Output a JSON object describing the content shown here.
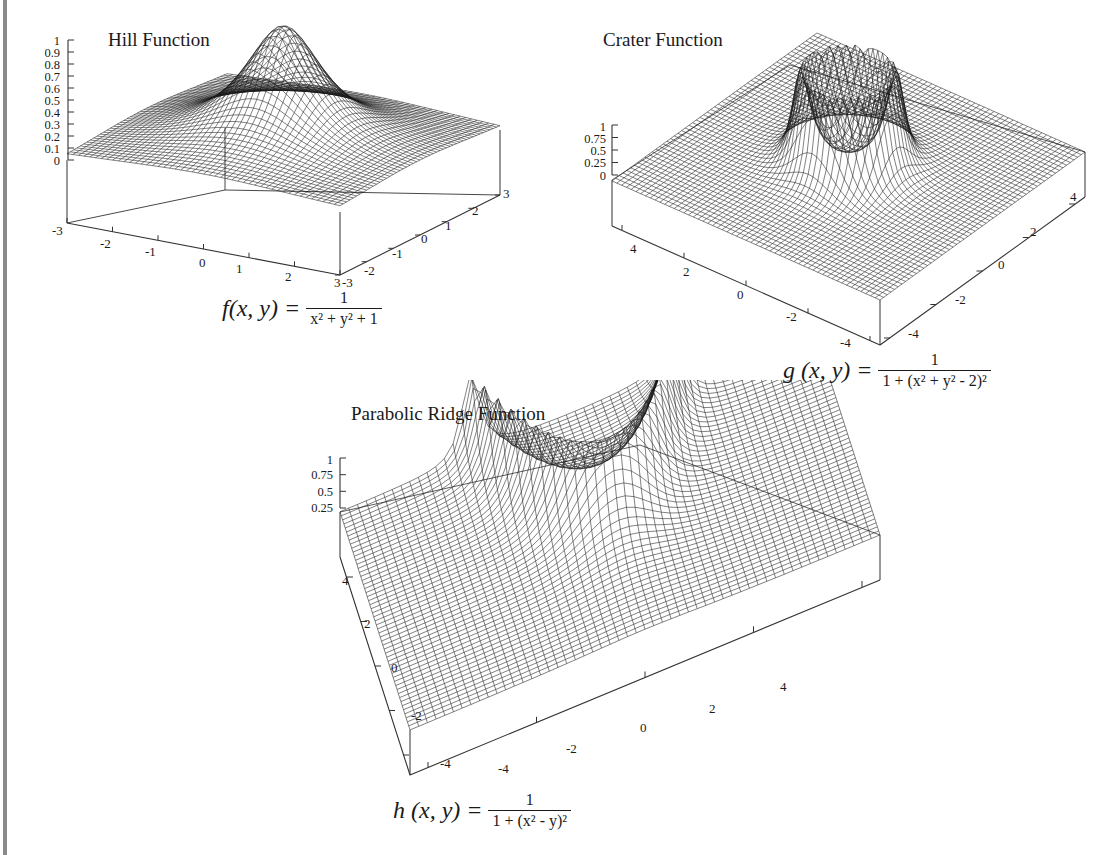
{
  "chart_data": [
    {
      "type": "surface3d",
      "title": "Hill Function",
      "formula": {
        "lhs": "f(x, y) =",
        "numerator": "1",
        "denominator": "x² + y² + 1"
      },
      "function": "1/(x^2+y^2+1)",
      "x_range": [
        -3,
        3
      ],
      "y_range": [
        -3,
        3
      ],
      "z_range": [
        0,
        1
      ],
      "z_ticks": [
        "1",
        "0.9",
        "0.8",
        "0.7",
        "0.6",
        "0.5",
        "0.4",
        "0.3",
        "0.2",
        "0.1",
        "0"
      ],
      "x_ticks": [
        "-3",
        "-2",
        "-1",
        "0",
        "1",
        "2",
        "3"
      ],
      "y_ticks": [
        "-3",
        "-2",
        "-1",
        "0",
        "1",
        "2",
        "3"
      ],
      "grid": true
    },
    {
      "type": "surface3d",
      "title": "Crater Function",
      "formula": {
        "lhs": "g (x, y) =",
        "numerator": "1",
        "denominator": "1 + (x² + y² - 2)²"
      },
      "function": "1/(1+(x^2+y^2-2)^2)",
      "x_range": [
        -5,
        5
      ],
      "y_range": [
        -5,
        5
      ],
      "z_range": [
        0,
        1
      ],
      "z_ticks": [
        "1",
        "0.75",
        "0.5",
        "0.25",
        "0"
      ],
      "x_ticks": [
        "4",
        "2",
        "0",
        "-2",
        "-4"
      ],
      "y_ticks": [
        "-4",
        "-2",
        "0",
        "2",
        "4"
      ],
      "grid": true
    },
    {
      "type": "surface3d",
      "title": "Parabolic Ridge Function",
      "formula": {
        "lhs": "h (x, y) =",
        "numerator": "1",
        "denominator": "1 + (x² - y)²"
      },
      "function": "1/(1+(x^2-y)^2)",
      "x_range": [
        -5,
        5
      ],
      "y_range": [
        -5,
        5
      ],
      "z_range": [
        0,
        1
      ],
      "z_ticks": [
        "1",
        "0.75",
        "0.5",
        "0.25"
      ],
      "x_ticks": [
        "-4",
        "-2",
        "0",
        "2",
        "4"
      ],
      "y_ticks": [
        "4",
        "2",
        "0",
        "-2",
        "-4"
      ],
      "grid": true
    }
  ],
  "colors": {
    "mesh": "#1a1a1a",
    "axis": "#333333",
    "rule": "#8a8a8a",
    "background": "#ffffff"
  }
}
